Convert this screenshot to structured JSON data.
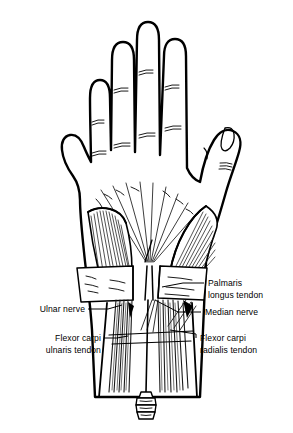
{
  "figure": {
    "title": "Palmar view of hand and wrist anatomy",
    "background_color": "#ffffff",
    "ink_color": "#000000",
    "hatch_color": "#1a1a1a"
  },
  "labels": [
    {
      "id": "palmaris-longus-tendon",
      "line1": "Palmaris",
      "line2": "longus tendon",
      "side": "right"
    },
    {
      "id": "median-nerve",
      "line1": "Median nerve",
      "line2": "",
      "side": "right"
    },
    {
      "id": "flexor-carpi-radialis-tendon",
      "line1": "Flexor carpi",
      "line2": "radialis tendon",
      "side": "right"
    },
    {
      "id": "ulnar-nerve",
      "line1": "Ulnar nerve",
      "line2": "",
      "side": "left"
    },
    {
      "id": "flexor-carpi-ulnaris-tendon",
      "line1": "Flexor carpi",
      "line2": "ulnaris tendon",
      "side": "left"
    }
  ],
  "anatomy_parts": [
    "hand-outline",
    "thumb",
    "index-finger",
    "middle-finger",
    "ring-finger",
    "little-finger",
    "palmar-aponeurosis",
    "thenar-eminence",
    "hypothenar-eminence",
    "flexor-retinaculum",
    "forearm-tendons",
    "needle",
    "syringe-hub"
  ]
}
